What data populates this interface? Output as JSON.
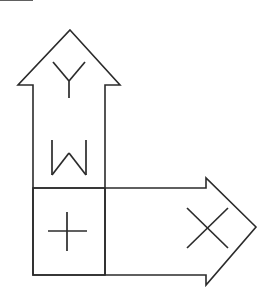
{
  "figure": {
    "background_color": "#ffffff",
    "stroke_color": "#2b2b2b",
    "stroke_width": 1.6,
    "canvas": {
      "width": 269,
      "height": 297
    },
    "shapes": [
      {
        "name": "up-arrow",
        "direction": "up",
        "points": "70,30 120,85 105,85 105,275 33,275 33,85 18,85",
        "closed": true
      },
      {
        "name": "right-arrow",
        "direction": "right",
        "points": "256,227 206,178 206,188 33,188 33,275 206,275 206,285",
        "closed": true
      }
    ],
    "dividers": [
      {
        "name": "horizontal-divider",
        "x1": 33,
        "y1": 188,
        "x2": 105,
        "y2": 188
      },
      {
        "name": "vertical-divider",
        "x1": 105,
        "y1": 188,
        "x2": 105,
        "y2": 275
      }
    ],
    "glyphs": [
      {
        "name": "glyph-y",
        "letter": "Y",
        "region": "up-arrow-upper-shaft",
        "center_x": 69,
        "center_y": 80,
        "strokes": [
          "M 53,62 L 69,81",
          "M 85,62 L 69,81",
          "M 69,81 L 69,98"
        ]
      },
      {
        "name": "glyph-w",
        "letter": "W",
        "region": "up-arrow-lower-shaft",
        "center_x": 69,
        "center_y": 158,
        "strokes": [
          "M 52,140 L 52,175",
          "M 52,175 L 69,153",
          "M 69,153 L 86,175",
          "M 86,175 L 86,140"
        ]
      },
      {
        "name": "glyph-plus",
        "letter": "+",
        "region": "intersection-box",
        "center_x": 67,
        "center_y": 231,
        "strokes": [
          "M 48,231 L 87,231",
          "M 67,212 L 67,251"
        ]
      },
      {
        "name": "glyph-x",
        "letter": "X",
        "region": "right-arrowhead",
        "center_x": 207,
        "center_y": 228,
        "strokes": [
          "M 187,208 L 228,248",
          "M 228,208 L 187,248"
        ]
      }
    ]
  }
}
